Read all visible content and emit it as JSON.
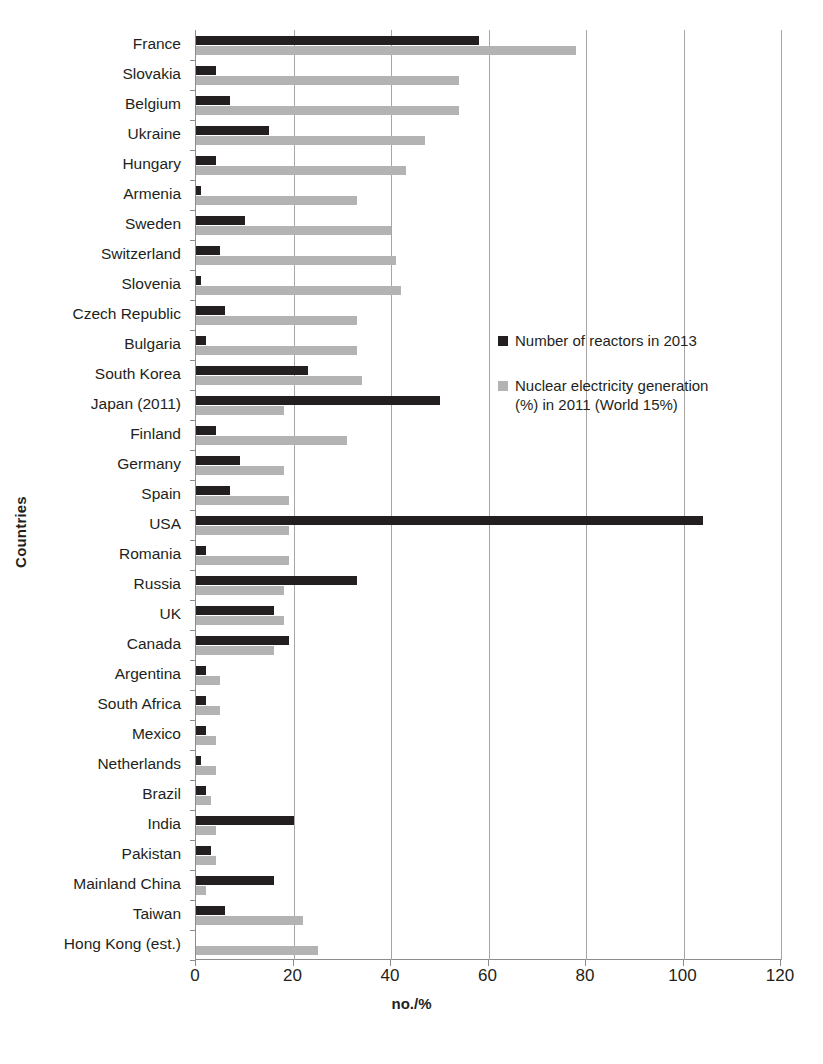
{
  "chart_data": {
    "type": "bar",
    "orientation": "horizontal",
    "title": "",
    "xlabel": "no./%",
    "ylabel": "Countries",
    "xlim": [
      0,
      120
    ],
    "xticks": [
      0,
      20,
      40,
      60,
      80,
      100,
      120
    ],
    "grid": true,
    "legend_position": "inside-right",
    "categories": [
      "France",
      "Slovakia",
      "Belgium",
      "Ukraine",
      "Hungary",
      "Armenia",
      "Sweden",
      "Switzerland",
      "Slovenia",
      "Czech Republic",
      "Bulgaria",
      "South Korea",
      "Japan (2011)",
      "Finland",
      "Germany",
      "Spain",
      "USA",
      "Romania",
      "Russia",
      "UK",
      "Canada",
      "Argentina",
      "South Africa",
      "Mexico",
      "Netherlands",
      "Brazil",
      "India",
      "Pakistan",
      "Mainland China",
      "Taiwan",
      "Hong Kong (est.)"
    ],
    "series": [
      {
        "name": "Number of reactors in 2013",
        "color": "#231f20",
        "values": [
          58,
          4,
          7,
          15,
          4,
          1,
          10,
          5,
          1,
          6,
          2,
          23,
          50,
          4,
          9,
          7,
          104,
          2,
          33,
          16,
          19,
          2,
          2,
          2,
          1,
          2,
          20,
          3,
          16,
          6,
          0
        ]
      },
      {
        "name": "Nuclear electricity generation (%) in 2011 (World 15%)",
        "color": "#b3b3b3",
        "values": [
          78,
          54,
          54,
          47,
          43,
          33,
          40,
          41,
          42,
          33,
          33,
          34,
          18,
          31,
          18,
          19,
          19,
          19,
          18,
          18,
          16,
          5,
          5,
          4,
          4,
          3,
          4,
          4,
          2,
          22,
          25
        ]
      }
    ]
  },
  "legend": {
    "items": [
      {
        "label": "Number of reactors in 2013",
        "swatch": "dark"
      },
      {
        "label": "Nuclear electricity generation\n(%) in 2011 (World 15%)",
        "swatch": "light"
      }
    ]
  },
  "axes": {
    "x_title": "no./%",
    "y_title": "Countries",
    "x_tick_labels": [
      "0",
      "20",
      "40",
      "60",
      "80",
      "100",
      "120"
    ]
  },
  "colors": {
    "series_dark": "#231f20",
    "series_light": "#b3b3b3",
    "gridline": "#a6a6a6",
    "axis": "#8c8c8c",
    "background": "#ffffff"
  }
}
